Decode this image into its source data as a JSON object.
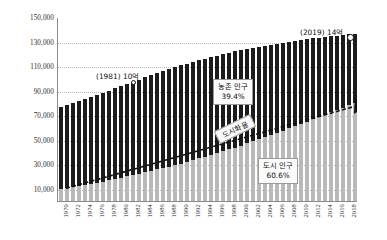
{
  "chart_data": {
    "type": "bar",
    "title": "",
    "subtitle": "",
    "xlabel": "",
    "ylabel": "",
    "ylim": [
      0,
      150000
    ],
    "grid": true,
    "legend_position": "none",
    "ytick_labels": [
      "150,000",
      "130,000",
      "110,000",
      "90,000",
      "70,000",
      "50,000",
      "30,000",
      "10,000"
    ],
    "ytick_values": [
      150000,
      130000,
      110000,
      90000,
      70000,
      50000,
      30000,
      10000
    ],
    "categories": [
      "1970",
      "1971",
      "1972",
      "1973",
      "1974",
      "1975",
      "1976",
      "1977",
      "1978",
      "1979",
      "1980",
      "1981",
      "1982",
      "1983",
      "1984",
      "1985",
      "1986",
      "1987",
      "1988",
      "1989",
      "1990",
      "1991",
      "1992",
      "1993",
      "1994",
      "1995",
      "1996",
      "1997",
      "1998",
      "1999",
      "2000",
      "2001",
      "2002",
      "2003",
      "2004",
      "2005",
      "2006",
      "2007",
      "2008",
      "2009",
      "2010",
      "2011",
      "2012",
      "2013",
      "2014",
      "2015",
      "2016",
      "2017",
      "2018",
      "2019"
    ],
    "xtick_labels": [
      "1970",
      "1972",
      "1974",
      "1976",
      "1978",
      "1980",
      "1982",
      "1984",
      "1986",
      "1988",
      "1990",
      "1992",
      "1994",
      "1996",
      "1998",
      "2000",
      "2002",
      "2004",
      "2006",
      "2008",
      "2010",
      "2012",
      "2014",
      "2016",
      "2018"
    ],
    "series": [
      {
        "name": "total",
        "color": "#1c1c1c",
        "values": [
          77000,
          78600,
          80200,
          81800,
          83400,
          85000,
          86600,
          88300,
          90000,
          91800,
          93600,
          95400,
          97200,
          99000,
          100700,
          102400,
          104100,
          105800,
          107400,
          109000,
          110600,
          112000,
          113400,
          114700,
          116000,
          117300,
          118500,
          119700,
          120800,
          121900,
          123000,
          124000,
          124900,
          125800,
          126600,
          127400,
          128200,
          129000,
          129700,
          130400,
          131100,
          131800,
          132500,
          133100,
          133700,
          134300,
          134900,
          135500,
          136000,
          136500
        ]
      },
      {
        "name": "urban",
        "color": "#b9b9b9",
        "values": [
          10000,
          10800,
          11600,
          12400,
          13200,
          14100,
          15000,
          15900,
          16900,
          17900,
          18900,
          20000,
          21100,
          22200,
          23300,
          24500,
          25700,
          26900,
          28100,
          29300,
          30500,
          31900,
          33300,
          34700,
          36100,
          37600,
          39100,
          40600,
          42100,
          43600,
          45200,
          46900,
          48600,
          50300,
          52000,
          53800,
          55600,
          57400,
          59200,
          61000,
          62900,
          64800,
          66700,
          68600,
          70500,
          72400,
          74300,
          76200,
          78100,
          80000
        ]
      }
    ],
    "annotations": [
      {
        "id": "point-1981",
        "text": "(1981) 10억",
        "year": "1981",
        "value": 10
      },
      {
        "id": "point-2019",
        "text": "(2019) 14억",
        "year": "2019",
        "value": 14
      },
      {
        "id": "rural-share",
        "line1": "농촌 인구",
        "line2": "39.4%"
      },
      {
        "id": "urban-share",
        "line1": "도시 인구",
        "line2": "60.6%"
      },
      {
        "id": "urbanization-rate",
        "text": "도시화율"
      }
    ]
  }
}
